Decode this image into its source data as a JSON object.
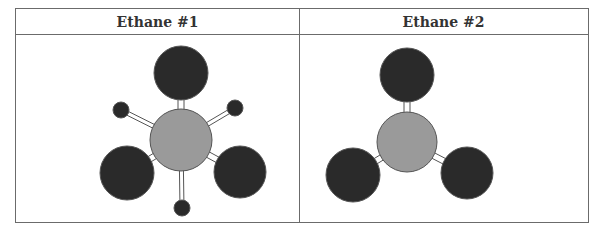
{
  "table": {
    "columns": [
      {
        "header": "Ethane #1"
      },
      {
        "header": "Ethane #2"
      }
    ]
  },
  "diagram": {
    "colors": {
      "central_atom": "#9a9a9a",
      "large_atom": "#2a2a2a",
      "small_atom": "#2a2a2a",
      "outline": "#555555",
      "bond": "#ffffff"
    },
    "panels": [
      {
        "name": "ethane-1",
        "central": {
          "cx": 181,
          "cy": 140,
          "r": 31
        },
        "large_atoms": [
          {
            "cx": 181,
            "cy": 73,
            "r": 27
          },
          {
            "cx": 127,
            "cy": 173,
            "r": 27
          },
          {
            "cx": 240,
            "cy": 172,
            "r": 26
          }
        ],
        "small_atoms": [
          {
            "cx": 121,
            "cy": 110,
            "r": 8
          },
          {
            "cx": 235,
            "cy": 108,
            "r": 8
          },
          {
            "cx": 182,
            "cy": 208,
            "r": 8
          }
        ]
      },
      {
        "name": "ethane-2",
        "central": {
          "cx": 407,
          "cy": 142,
          "r": 30
        },
        "large_atoms": [
          {
            "cx": 407,
            "cy": 75,
            "r": 27
          },
          {
            "cx": 353,
            "cy": 175,
            "r": 27
          },
          {
            "cx": 467,
            "cy": 173,
            "r": 26
          }
        ],
        "small_atoms": []
      }
    ]
  }
}
